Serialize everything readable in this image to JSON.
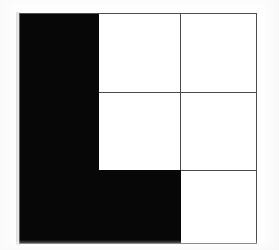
{
  "figure": {
    "shape_name": "L-shape",
    "background_color": "#ffffff",
    "fill_color": "#070707",
    "empty_color": "#ffffff",
    "line_color": "#4a4a4a",
    "grid": {
      "rows": 3,
      "columns": 3,
      "cells": [
        {
          "id": "r1c1",
          "row": 1,
          "column": 1,
          "state": "filled",
          "color": "#070707"
        },
        {
          "id": "r1c2",
          "row": 1,
          "column": 2,
          "state": "empty",
          "color": "#ffffff"
        },
        {
          "id": "r1c3",
          "row": 1,
          "column": 3,
          "state": "empty",
          "color": "#ffffff"
        },
        {
          "id": "r2c1",
          "row": 2,
          "column": 1,
          "state": "filled",
          "color": "#070707"
        },
        {
          "id": "r2c2",
          "row": 2,
          "column": 2,
          "state": "empty",
          "color": "#ffffff"
        },
        {
          "id": "r2c3",
          "row": 2,
          "column": 3,
          "state": "empty",
          "color": "#ffffff"
        },
        {
          "id": "r3c1",
          "row": 3,
          "column": 1,
          "state": "filled",
          "color": "#070707"
        },
        {
          "id": "r3c2",
          "row": 3,
          "column": 2,
          "state": "filled",
          "color": "#070707"
        },
        {
          "id": "r3c3",
          "row": 3,
          "column": 3,
          "state": "empty",
          "color": "#ffffff"
        }
      ],
      "filled_count": 4,
      "empty_count": 5
    }
  }
}
